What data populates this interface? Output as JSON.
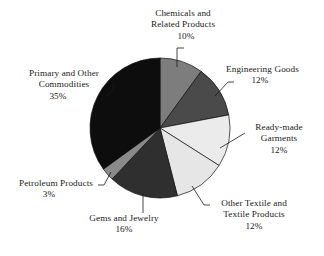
{
  "chart_data": {
    "type": "pie",
    "title": "",
    "subtitle": "",
    "xlabel": "",
    "ylabel": "",
    "legend_position": "none",
    "grid": false,
    "start_angle_clock_position": "12 o'clock",
    "direction": "clockwise",
    "unit": "%",
    "categories": [
      "Chemicals and Related Products",
      "Engineering Goods",
      "Ready-made Garments",
      "Other Textile and Textile Products",
      "Gems and Jewelry",
      "Petroleum Products",
      "Primary and Other Commodities"
    ],
    "values": [
      10,
      12,
      12,
      12,
      16,
      3,
      35
    ],
    "slices": [
      {
        "name": "Chemicals and Related Products",
        "value": 10,
        "value_label": "10%",
        "color": "#7d7d7d",
        "label_lines": [
          "Chemicals and",
          "Related Products"
        ],
        "label_position": "top"
      },
      {
        "name": "Engineering Goods",
        "value": 12,
        "value_label": "12%",
        "color": "#4a4a4a",
        "label_lines": [
          "Engineering Goods"
        ],
        "label_position": "upper-right"
      },
      {
        "name": "Ready-made Garments",
        "value": 12,
        "value_label": "12%",
        "color": "#ebebeb",
        "label_lines": [
          "Ready-made",
          "Garments"
        ],
        "label_position": "right"
      },
      {
        "name": "Other Textile and Textile Products",
        "value": 12,
        "value_label": "12%",
        "color": "#e6e6e6",
        "label_lines": [
          "Other Textile and",
          "Textile Products"
        ],
        "label_position": "lower-right"
      },
      {
        "name": "Gems and Jewelry",
        "value": 16,
        "value_label": "16%",
        "color": "#2f2f2f",
        "label_lines": [
          "Gems and Jewelry"
        ],
        "label_position": "bottom"
      },
      {
        "name": "Petroleum Products",
        "value": 3,
        "value_label": "3%",
        "color": "#8a8a8a",
        "label_lines": [
          "Petroleum Products"
        ],
        "label_position": "lower-left"
      },
      {
        "name": "Primary and Other Commodities",
        "value": 35,
        "value_label": "35%",
        "color": "#0d0d0d",
        "label_lines": [
          "Primary and Other",
          "Commodities"
        ],
        "label_position": "upper-left"
      }
    ]
  },
  "labels": {
    "chemicals": {
      "line1": "Chemicals and",
      "line2": "Related Products",
      "pct": "10%"
    },
    "engineering": {
      "line1": "Engineering Goods",
      "pct": "12%"
    },
    "readymade": {
      "line1": "Ready-made",
      "line2": "Garments",
      "pct": "12%"
    },
    "othertextile": {
      "line1": "Other Textile and",
      "line2": "Textile Products",
      "pct": "12%"
    },
    "gems": {
      "line1": "Gems and Jewelry",
      "pct": "16%"
    },
    "petroleum": {
      "line1": "Petroleum Products",
      "pct": "3%"
    },
    "primary": {
      "line1": "Primary and Other",
      "line2": "Commodities",
      "pct": "35%"
    }
  }
}
